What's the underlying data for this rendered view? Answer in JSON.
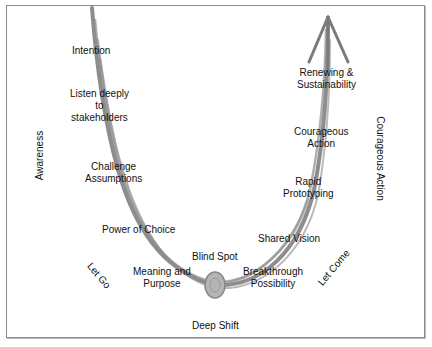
{
  "diagram": {
    "type": "U-process",
    "colors": {
      "curve": "#7a7a7a",
      "frame": "#8a8a8a",
      "text": "#111111"
    },
    "left_side_labels": {
      "axis": "Awareness",
      "phase": "Let Go"
    },
    "right_side_labels": {
      "axis": "Courageous Action",
      "phase": "Let Come"
    },
    "bottom_label": "Deep Shift",
    "descending_steps": [
      {
        "text": "Intention"
      },
      {
        "line1": "Listen deeply",
        "line2": "to",
        "line3": "stakeholders"
      },
      {
        "line1": "Challenge",
        "line2": "Assumptions"
      },
      {
        "text": "Power of Choice"
      },
      {
        "line1": "Meaning and",
        "line2": "Purpose"
      }
    ],
    "bottom_step": "Blind Spot",
    "ascending_steps": [
      {
        "line1": "Breakthrough",
        "line2": "Possibility"
      },
      {
        "text": "Shared Vision"
      },
      {
        "line1": "Rapid",
        "line2": "Prototyping"
      },
      {
        "line1": "Courageous",
        "line2": "Action"
      },
      {
        "line1": "Renewing &",
        "line2": "Sustainability"
      }
    ]
  }
}
